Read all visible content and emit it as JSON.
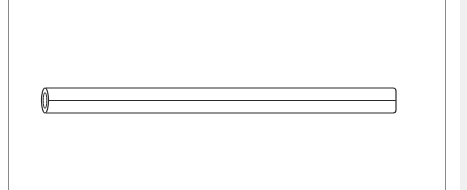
{
  "figure": {
    "stroke_color": "#2a2a2a",
    "background_color": "#ffffff",
    "frame_color": "#8a8a8a",
    "side_strip_color": "#f0f0f0"
  }
}
